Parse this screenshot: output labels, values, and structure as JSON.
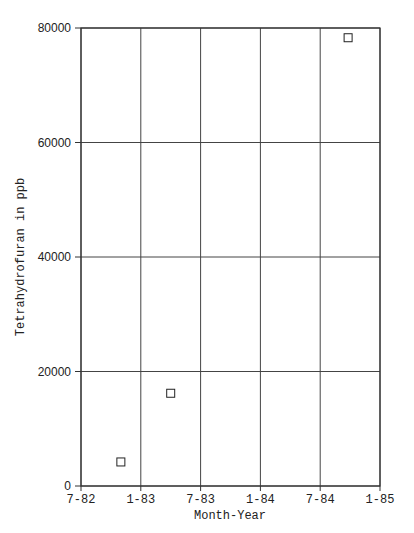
{
  "chart_data": {
    "type": "scatter",
    "title": "",
    "xlabel": "Month-Year",
    "ylabel": "Tetrahydrofuran in ppb",
    "x_tick_labels": [
      "7-82",
      "1-83",
      "7-83",
      "1-84",
      "7-84",
      "1-85"
    ],
    "y_tick_labels": [
      "0",
      "20000",
      "40000",
      "60000",
      "80000"
    ],
    "y_ticks": [
      0,
      20000,
      40000,
      60000,
      80000
    ],
    "ylim": [
      0,
      80000
    ],
    "xlim_months": [
      0,
      30
    ],
    "x_reference": "7-82 = month 0",
    "grid": true,
    "legend": null,
    "marker": "open-square",
    "series": [
      {
        "name": "Tetrahydrofuran",
        "points": [
          {
            "x": "11-82",
            "x_months": 4.0,
            "y": 4200
          },
          {
            "x": "4-83",
            "x_months": 9.0,
            "y": 16200
          },
          {
            "x": "10-84",
            "x_months": 26.8,
            "y": 78300
          }
        ]
      }
    ]
  }
}
